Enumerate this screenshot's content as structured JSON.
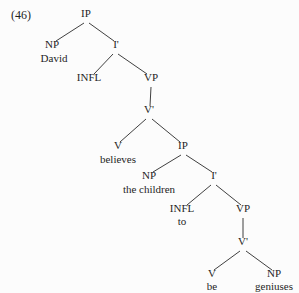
{
  "figure": {
    "example_number": "(46)",
    "kind": "syntax-tree",
    "sentence": "David believes the children to be geniuses"
  },
  "nodes": [
    {
      "id": "ip1",
      "label": "IP",
      "x": 86,
      "y": 19
    },
    {
      "id": "np1",
      "label": "NP",
      "x": 52,
      "y": 50
    },
    {
      "id": "david",
      "label": "David",
      "x": 54,
      "y": 64
    },
    {
      "id": "ibar1",
      "label": "I'",
      "x": 116,
      "y": 50
    },
    {
      "id": "infl1",
      "label": "INFL",
      "x": 89,
      "y": 83
    },
    {
      "id": "vp1",
      "label": "VP",
      "x": 151,
      "y": 83
    },
    {
      "id": "vbar1",
      "label": "V'",
      "x": 149,
      "y": 115
    },
    {
      "id": "v1",
      "label": "V",
      "x": 118,
      "y": 151
    },
    {
      "id": "believes",
      "label": "believes",
      "x": 118,
      "y": 165
    },
    {
      "id": "ip2",
      "label": "IP",
      "x": 183,
      "y": 151
    },
    {
      "id": "np2",
      "label": "NP",
      "x": 149,
      "y": 181
    },
    {
      "id": "children",
      "label": "the children",
      "x": 149,
      "y": 195
    },
    {
      "id": "ibar2",
      "label": "I'",
      "x": 214,
      "y": 181
    },
    {
      "id": "infl2",
      "label": "INFL",
      "x": 182,
      "y": 214
    },
    {
      "id": "to",
      "label": "to",
      "x": 182,
      "y": 227
    },
    {
      "id": "vp2",
      "label": "VP",
      "x": 243,
      "y": 214
    },
    {
      "id": "vbar2",
      "label": "V'",
      "x": 243,
      "y": 247
    },
    {
      "id": "v2",
      "label": "V",
      "x": 212,
      "y": 279
    },
    {
      "id": "be",
      "label": "be",
      "x": 212,
      "y": 292
    },
    {
      "id": "np3",
      "label": "NP",
      "x": 274,
      "y": 279
    },
    {
      "id": "geniuses",
      "label": "geniuses",
      "x": 274,
      "y": 292
    }
  ],
  "edges": [
    {
      "from": "ip1",
      "to": "np1",
      "x1": 84,
      "y1": 23,
      "x2": 56,
      "y2": 41
    },
    {
      "from": "ip1",
      "to": "ibar1",
      "x1": 89,
      "y1": 23,
      "x2": 114,
      "y2": 41
    },
    {
      "from": "ibar1",
      "to": "infl1",
      "x1": 113,
      "y1": 54,
      "x2": 94,
      "y2": 74
    },
    {
      "from": "ibar1",
      "to": "vp1",
      "x1": 118,
      "y1": 54,
      "x2": 147,
      "y2": 74
    },
    {
      "from": "vp1",
      "to": "vbar1",
      "x1": 151,
      "y1": 87,
      "x2": 150,
      "y2": 106
    },
    {
      "from": "vbar1",
      "to": "v1",
      "x1": 146,
      "y1": 119,
      "x2": 120,
      "y2": 142
    },
    {
      "from": "vbar1",
      "to": "ip2",
      "x1": 152,
      "y1": 119,
      "x2": 180,
      "y2": 142
    },
    {
      "from": "ip2",
      "to": "np2",
      "x1": 181,
      "y1": 155,
      "x2": 153,
      "y2": 172
    },
    {
      "from": "ip2",
      "to": "ibar2",
      "x1": 186,
      "y1": 155,
      "x2": 212,
      "y2": 172
    },
    {
      "from": "ibar2",
      "to": "infl2",
      "x1": 211,
      "y1": 185,
      "x2": 187,
      "y2": 205
    },
    {
      "from": "ibar2",
      "to": "vp2",
      "x1": 216,
      "y1": 185,
      "x2": 241,
      "y2": 205
    },
    {
      "from": "vp2",
      "to": "vbar2",
      "x1": 243,
      "y1": 218,
      "x2": 243,
      "y2": 238
    },
    {
      "from": "vbar2",
      "to": "v2",
      "x1": 240,
      "y1": 251,
      "x2": 214,
      "y2": 270
    },
    {
      "from": "vbar2",
      "to": "np3",
      "x1": 246,
      "y1": 251,
      "x2": 272,
      "y2": 270
    }
  ],
  "style": {
    "background": "#fcfcfc",
    "line_color": "#2a2a2a",
    "text_color": "#1f1f1f"
  }
}
